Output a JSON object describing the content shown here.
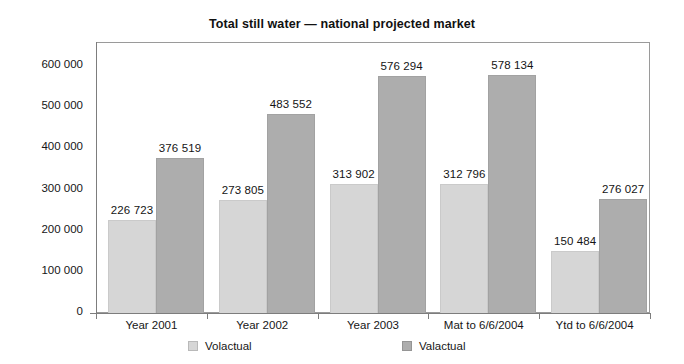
{
  "chart_data": {
    "type": "bar",
    "title": "Total still water — national projected market",
    "xlabel": "",
    "ylabel": "",
    "ylim": [
      0,
      600000
    ],
    "ytick_step": 100000,
    "ytick_labels": [
      "600 000",
      "500 000",
      "400 000",
      "300 000",
      "200 000",
      "100 000",
      "0"
    ],
    "ytick_values": [
      600000,
      500000,
      400000,
      300000,
      200000,
      100000,
      0
    ],
    "grid": false,
    "legend_position": "bottom",
    "categories": [
      "Year 2001",
      "Year 2002",
      "Year 2003",
      "Mat to 6/6/2004",
      "Ytd to 6/6/2004"
    ],
    "series": [
      {
        "name": "Volactual",
        "color": "#d6d6d6",
        "values": [
          226723,
          273805,
          313902,
          312796,
          150484
        ],
        "labels": [
          "226 723",
          "273 805",
          "313 902",
          "312 796",
          "150 484"
        ]
      },
      {
        "name": "Valactual",
        "color": "#adadad",
        "values": [
          376519,
          483552,
          576294,
          578134,
          276027
        ],
        "labels": [
          "376 519",
          "483 552",
          "576 294",
          "578 134",
          "276 027"
        ]
      }
    ]
  },
  "legend": {
    "items": [
      {
        "label": "Volactual",
        "swatch_class": "vol"
      },
      {
        "label": "Valactual",
        "swatch_class": "val"
      }
    ]
  }
}
